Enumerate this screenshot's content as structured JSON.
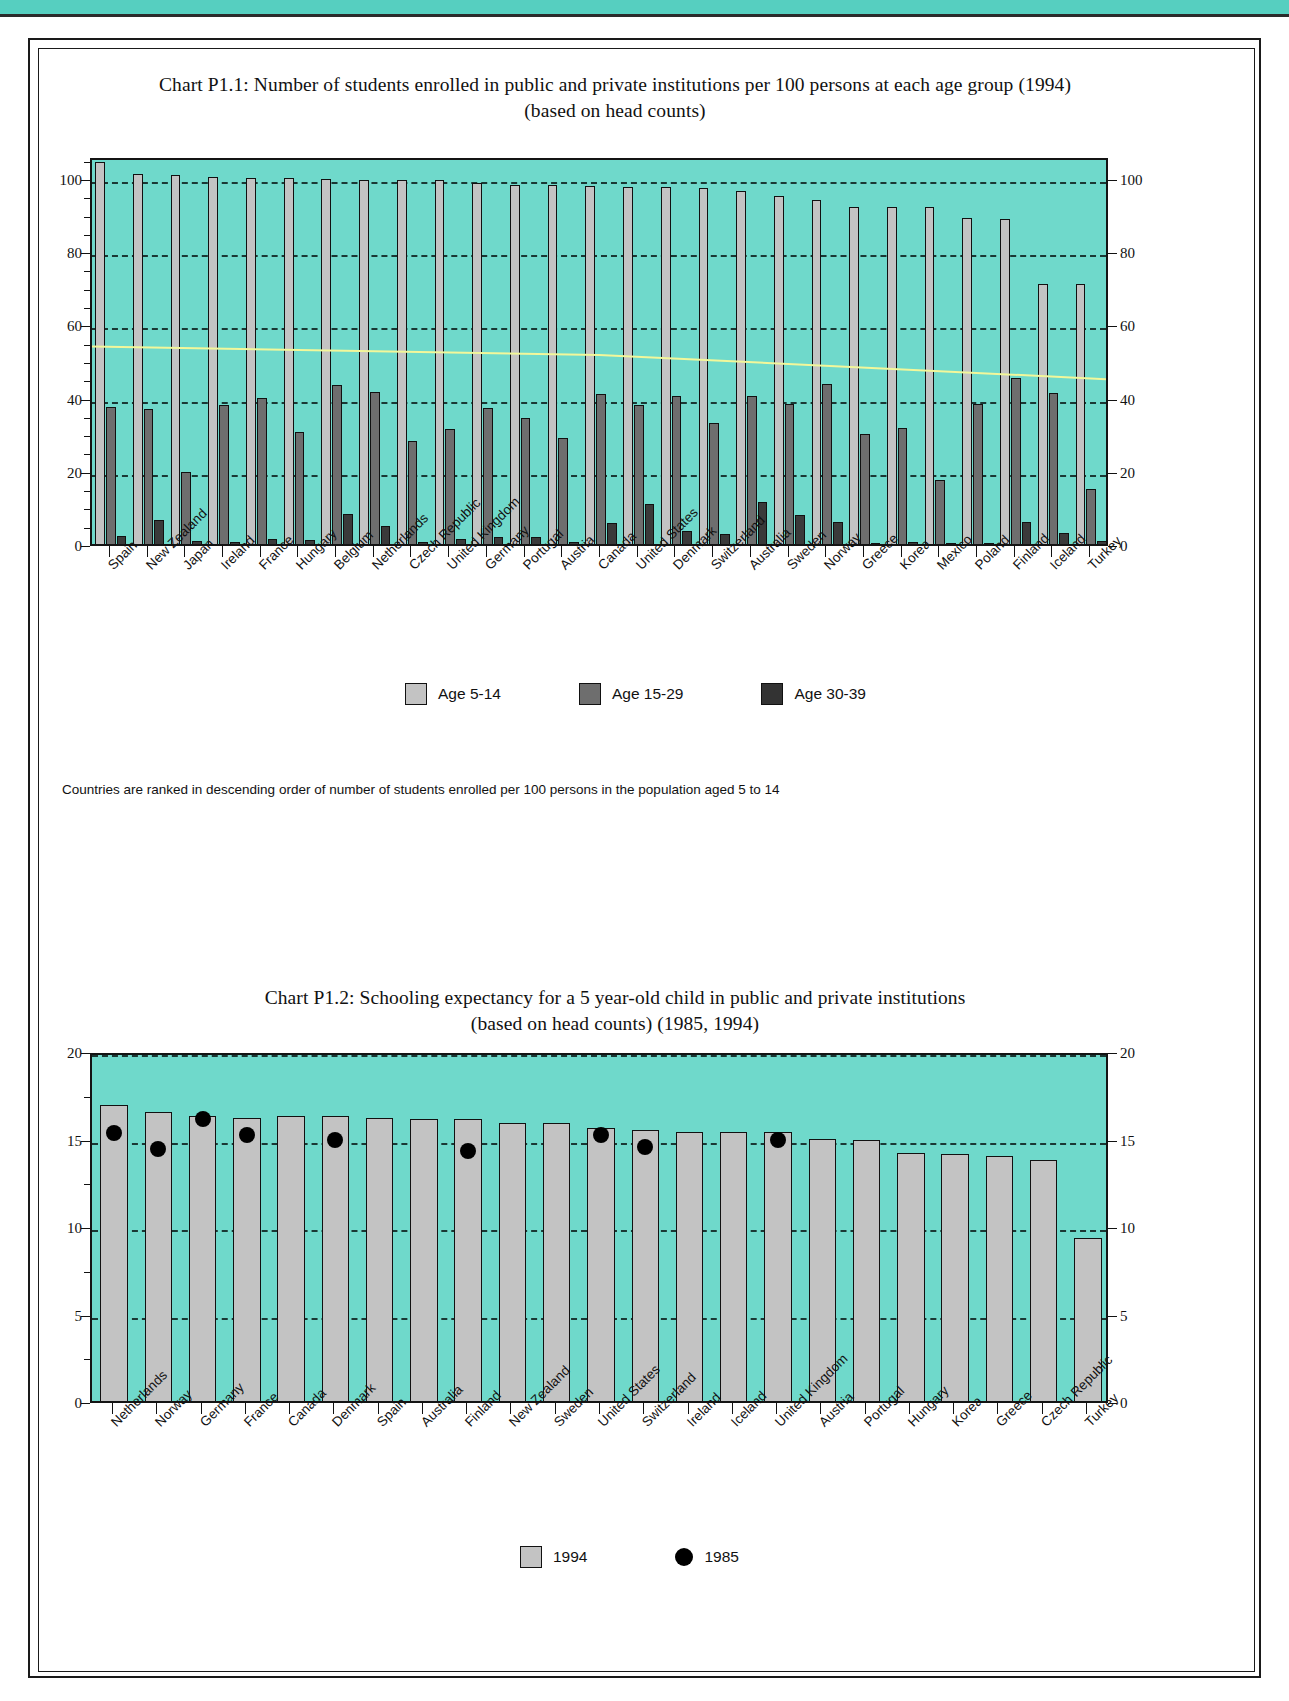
{
  "page": {
    "accent_color": "#56cfc0",
    "plot_background": "#6fd9cb",
    "series_colors": {
      "age_5_14": "#c3c3c3",
      "age_15_29": "#6e6e6e",
      "age_30_39": "#3a3a3a",
      "marker_1985": "#000000"
    }
  },
  "chart1": {
    "title_line1": "Chart P1.1: Number of students enrolled in public and private institutions per 100 persons at each age group (1994)",
    "title_line2": "(based on head counts)",
    "footnote": "Countries are ranked in descending order of number of  students enrolled per 100 persons in the population aged 5 to 14",
    "legend": [
      {
        "label": "Age 5-14",
        "color": "#c3c3c3"
      },
      {
        "label": "Age 15-29",
        "color": "#6e6e6e"
      },
      {
        "label": "Age 30-39",
        "color": "#333333"
      }
    ],
    "y_ticks": [
      "0",
      "20",
      "40",
      "60",
      "80",
      "100"
    ]
  },
  "chart2": {
    "title_line1": "Chart P1.2: Schooling expectancy for a 5 year-old child in public and private institutions",
    "title_line2": "(based on head counts) (1985, 1994)",
    "legend": [
      {
        "label": "1994",
        "color": "#c3c3c3"
      },
      {
        "label": "1985",
        "color": "#000000"
      }
    ],
    "y_ticks": [
      "0",
      "5",
      "10",
      "15",
      "20"
    ]
  },
  "chart_data": [
    {
      "id": "P1.1",
      "type": "bar",
      "title": "Chart P1.1: Number of students enrolled in public and private institutions per 100 persons at each age group (1994) (based on head counts)",
      "xlabel": "",
      "ylabel": "",
      "ylim": [
        0,
        106
      ],
      "grid": true,
      "legend_position": "bottom",
      "note": "Countries are ranked in descending order of number of  students enrolled per 100 persons in the population aged 5 to 14",
      "categories": [
        "Spain",
        "New Zealand",
        "Japan",
        "Ireland",
        "France",
        "Hungary",
        "Belgium",
        "Netherlands",
        "Czech Republic",
        "United Kingdom",
        "Germany",
        "Portugal",
        "Austria",
        "Canada",
        "United States",
        "Denmark",
        "Switzerland",
        "Australia",
        "Sweden",
        "Norway",
        "Greece",
        "Korea",
        "Mexico",
        "Poland",
        "Finland",
        "Iceland",
        "Turkey"
      ],
      "series": [
        {
          "name": "Age 5-14",
          "values": [
            104.5,
            101.0,
            100.8,
            100.2,
            100.1,
            100.0,
            99.6,
            99.5,
            99.5,
            99.5,
            98.6,
            98.2,
            98.0,
            97.8,
            97.6,
            97.5,
            97.2,
            96.5,
            95.2,
            94.0,
            92.0,
            92.0,
            92.0,
            89.2,
            88.8,
            71.0,
            71.0
          ]
        },
        {
          "name": "Age 15-29",
          "values": [
            37.5,
            36.8,
            19.8,
            38.0,
            39.8,
            30.5,
            43.5,
            41.5,
            28.2,
            31.5,
            37.2,
            34.5,
            29.0,
            41.0,
            38.0,
            40.5,
            33.0,
            40.5,
            38.3,
            43.8,
            30.0,
            31.8,
            17.6,
            38.2,
            45.3,
            41.2,
            15.0
          ]
        },
        {
          "name": "Age 30-39",
          "values": [
            2.2,
            6.6,
            0.8,
            0.6,
            1.5,
            1.0,
            8.2,
            4.8,
            0.5,
            1.5,
            2.0,
            1.8,
            0.6,
            5.8,
            10.8,
            3.5,
            2.8,
            11.4,
            8.0,
            6.0,
            0.4,
            0.5,
            0.3,
            0.4,
            6.0,
            3.0,
            0.8
          ]
        }
      ]
    },
    {
      "id": "P1.2",
      "type": "bar",
      "title": "Chart P1.2: Schooling expectancy for a 5 year-old child in public and private institutions (based on head counts) (1985, 1994)",
      "xlabel": "",
      "ylabel": "",
      "ylim": [
        0,
        20
      ],
      "grid": true,
      "legend_position": "bottom",
      "categories": [
        "Netherlands",
        "Norway",
        "Germany",
        "France",
        "Canada",
        "Denmark",
        "Spain",
        "Australia",
        "Finland",
        "New Zealand",
        "Sweden",
        "United States",
        "Switzerland",
        "Ireland",
        "Iceland",
        "United Kingdom",
        "Austria",
        "Portugal",
        "Hungary",
        "Korea",
        "Greece",
        "Czech Republic",
        "Turkey"
      ],
      "series": [
        {
          "name": "1994",
          "values": [
            16.9,
            16.5,
            16.3,
            16.2,
            16.3,
            16.3,
            16.2,
            16.1,
            16.1,
            15.9,
            15.9,
            15.6,
            15.5,
            15.4,
            15.4,
            15.4,
            15.0,
            14.9,
            14.2,
            14.1,
            14.0,
            13.8,
            9.3
          ]
        },
        {
          "name": "1985",
          "type": "scatter",
          "values": [
            15.3,
            14.4,
            16.1,
            15.2,
            null,
            14.9,
            null,
            null,
            14.3,
            null,
            null,
            15.2,
            14.5,
            null,
            null,
            14.9,
            null,
            null,
            null,
            null,
            null,
            null,
            null
          ]
        }
      ]
    }
  ]
}
